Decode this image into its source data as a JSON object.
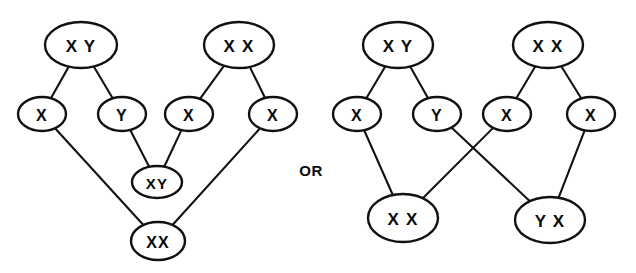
{
  "figure": {
    "connector_label": "OR",
    "stroke_color": "#111111",
    "fill_color": "#ffffff",
    "text_color": "#0a0a0a",
    "width": 636,
    "height": 273
  },
  "diagrams": [
    {
      "id": "left-diagram",
      "name": "left-pedigree",
      "nodes": [
        {
          "id": "L-top-xy",
          "label": "X Y",
          "cx": 81,
          "cy": 45,
          "rx": 36,
          "ry": 23,
          "font_size": 17
        },
        {
          "id": "L-top-xx",
          "label": "X X",
          "cx": 239,
          "cy": 45,
          "rx": 35,
          "ry": 23,
          "font_size": 17
        },
        {
          "id": "L-mid-x1",
          "label": "X",
          "cx": 42,
          "cy": 114,
          "rx": 24,
          "ry": 17,
          "font_size": 16
        },
        {
          "id": "L-mid-y",
          "label": "Y",
          "cx": 122,
          "cy": 114,
          "rx": 24,
          "ry": 17,
          "font_size": 16
        },
        {
          "id": "L-mid-x2",
          "label": "X",
          "cx": 189,
          "cy": 114,
          "rx": 24,
          "ry": 17,
          "font_size": 16
        },
        {
          "id": "L-mid-x3",
          "label": "X",
          "cx": 273,
          "cy": 114,
          "rx": 24,
          "ry": 17,
          "font_size": 16
        },
        {
          "id": "L-low-xy",
          "label": "XY",
          "cx": 157,
          "cy": 182,
          "rx": 25,
          "ry": 16,
          "font_size": 15
        },
        {
          "id": "L-bot-xx",
          "label": "XX",
          "cx": 158,
          "cy": 241,
          "rx": 27,
          "ry": 19,
          "font_size": 16
        }
      ],
      "edges": [
        {
          "from": "L-top-xy",
          "to": "L-mid-x1",
          "name": "edge-xy-to-x1"
        },
        {
          "from": "L-top-xy",
          "to": "L-mid-y",
          "name": "edge-xy-to-y"
        },
        {
          "from": "L-top-xx",
          "to": "L-mid-x2",
          "name": "edge-xx-to-x2"
        },
        {
          "from": "L-top-xx",
          "to": "L-mid-x3",
          "name": "edge-xx-to-x3"
        },
        {
          "from": "L-mid-y",
          "to": "L-low-xy",
          "name": "edge-y-to-xy"
        },
        {
          "from": "L-mid-x2",
          "to": "L-low-xy",
          "name": "edge-x2-to-xy"
        },
        {
          "from": "L-mid-x1",
          "to": "L-bot-xx",
          "name": "edge-x1-to-xx"
        },
        {
          "from": "L-mid-x3",
          "to": "L-bot-xx",
          "name": "edge-x3-to-xx"
        }
      ]
    },
    {
      "id": "right-diagram",
      "name": "right-pedigree",
      "nodes": [
        {
          "id": "R-top-xy",
          "label": "X Y",
          "cx": 398,
          "cy": 45,
          "rx": 35,
          "ry": 23,
          "font_size": 17
        },
        {
          "id": "R-top-xx",
          "label": "X X",
          "cx": 548,
          "cy": 45,
          "rx": 35,
          "ry": 23,
          "font_size": 17
        },
        {
          "id": "R-mid-x1",
          "label": "X",
          "cx": 357,
          "cy": 114,
          "rx": 24,
          "ry": 17,
          "font_size": 16
        },
        {
          "id": "R-mid-y",
          "label": "Y",
          "cx": 437,
          "cy": 114,
          "rx": 24,
          "ry": 17,
          "font_size": 16
        },
        {
          "id": "R-mid-x2",
          "label": "X",
          "cx": 507,
          "cy": 114,
          "rx": 24,
          "ry": 17,
          "font_size": 16
        },
        {
          "id": "R-mid-x3",
          "label": "X",
          "cx": 591,
          "cy": 114,
          "rx": 24,
          "ry": 17,
          "font_size": 16
        },
        {
          "id": "R-bot-xx",
          "label": "X X",
          "cx": 403,
          "cy": 218,
          "rx": 35,
          "ry": 24,
          "font_size": 17
        },
        {
          "id": "R-bot-yx",
          "label": "Y X",
          "cx": 550,
          "cy": 220,
          "rx": 35,
          "ry": 23,
          "font_size": 17
        }
      ],
      "edges": [
        {
          "from": "R-top-xy",
          "to": "R-mid-x1",
          "name": "edge-xy-to-x1"
        },
        {
          "from": "R-top-xy",
          "to": "R-mid-y",
          "name": "edge-xy-to-y"
        },
        {
          "from": "R-top-xx",
          "to": "R-mid-x2",
          "name": "edge-xx-to-x2"
        },
        {
          "from": "R-top-xx",
          "to": "R-mid-x3",
          "name": "edge-xx-to-x3"
        },
        {
          "from": "R-mid-x1",
          "to": "R-bot-xx",
          "name": "edge-x1-to-xx"
        },
        {
          "from": "R-mid-y",
          "to": "R-bot-yx",
          "name": "edge-y-to-yx-crossing"
        },
        {
          "from": "R-mid-x2",
          "to": "R-bot-xx",
          "name": "edge-x2-to-xx-crossing"
        },
        {
          "from": "R-mid-x3",
          "to": "R-bot-yx",
          "name": "edge-x3-to-yx"
        }
      ]
    }
  ],
  "connector": {
    "label": "OR",
    "x": 311,
    "y": 170
  }
}
